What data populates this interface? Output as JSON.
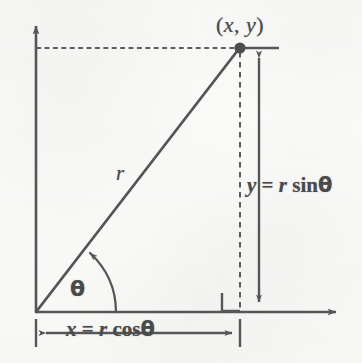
{
  "diagram": {
    "stroke_color": "#555555",
    "background_color": "#fbfbfa",
    "labels": {
      "point": "( x, y )",
      "point_x": "x",
      "point_y": "y",
      "radius": "r",
      "angle": "θ",
      "y_equation": "y = r sinθ",
      "y_eq_lhs": "y",
      "y_eq_sign": "=",
      "y_eq_r": "r",
      "y_eq_fn": "sin",
      "y_eq_theta": "θ",
      "x_equation": "x = r cosθ",
      "x_eq_lhs": "x",
      "x_eq_sign": "=",
      "x_eq_r": "r",
      "x_eq_fn": "cos",
      "x_eq_theta": "θ"
    },
    "geometry": {
      "origin": {
        "x": 36,
        "y": 312
      },
      "point": {
        "x": 240,
        "y": 48
      },
      "x_axis_arrow_tip": {
        "x": 345,
        "y": 312
      },
      "y_axis_arrow_tip": {
        "x": 36,
        "y": 17
      },
      "y_measure_line_x": 259,
      "right_angle_marker": {
        "x": 222,
        "y": 292,
        "size": 18
      },
      "angle_arc_radius": 80
    },
    "icon_names": [
      "y-axis-arrow-icon",
      "x-axis-arrow-icon",
      "point-dot-icon",
      "right-angle-marker-icon",
      "angle-arc-arrow-icon",
      "y-measure-double-arrow-icon",
      "x-measure-double-arrow-icon"
    ]
  }
}
